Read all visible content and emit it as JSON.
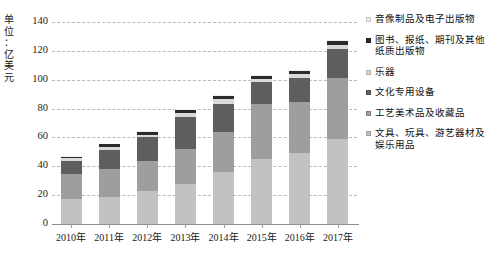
{
  "chart_data": {
    "type": "bar",
    "subtype": "stacked-vertical",
    "title": "",
    "xlabel": "",
    "ylabel": "单位：亿美元",
    "ylim": [
      0,
      140
    ],
    "ytick_step": 20,
    "yticks": [
      "140",
      "120",
      "100",
      "80",
      "60",
      "40",
      "20",
      "0"
    ],
    "grid": true,
    "grid_style": "dashed-horizontal",
    "legend_position": "right",
    "categories": [
      "2010年",
      "2011年",
      "2012年",
      "2013年",
      "2014年",
      "2015年",
      "2016年",
      "2017年"
    ],
    "series": [
      {
        "name": "文具、玩具、游艺器材及娱乐用品",
        "color": "#c2c2c2",
        "values": [
          17.0,
          18.5,
          23.0,
          27.5,
          36.0,
          45.0,
          49.0,
          59.0
        ]
      },
      {
        "name": "工艺美术品及收藏品",
        "color": "#9e9e9e",
        "values": [
          17.5,
          19.5,
          21.0,
          24.5,
          27.5,
          38.0,
          35.5,
          42.0
        ]
      },
      {
        "name": "文化专用设备",
        "color": "#5e5e5e",
        "values": [
          9.5,
          13.5,
          16.0,
          22.5,
          19.5,
          15.5,
          16.5,
          20.5
        ]
      },
      {
        "name": "乐器",
        "color": "#d9d9d9",
        "values": [
          1.7,
          1.9,
          2.0,
          2.2,
          3.5,
          2.2,
          3.0,
          2.4
        ]
      },
      {
        "name": "图书、报纸、期刊及其他纸质出版物",
        "color": "#2b2b2b",
        "values": [
          1.0,
          1.8,
          1.8,
          2.6,
          2.4,
          2.0,
          2.2,
          3.2
        ]
      },
      {
        "name": "音像制品及电子出版物",
        "color": "#efefef",
        "values": [
          0.6,
          0.6,
          0.6,
          0.6,
          0.6,
          0.6,
          0.6,
          0.6
        ]
      }
    ],
    "totals": [
      47.3,
      55.8,
      64.4,
      79.9,
      89.5,
      103.3,
      106.8,
      127.7
    ]
  },
  "legend": {
    "items": [
      {
        "label": "音像制品及电子出版物",
        "color": "#efefef"
      },
      {
        "label": "图书、报纸、期刊及其他纸质出版物",
        "color": "#2b2b2b"
      },
      {
        "label": "乐器",
        "color": "#d9d9d9"
      },
      {
        "label": "文化专用设备",
        "color": "#5e5e5e"
      },
      {
        "label": "工艺美术品及收藏品",
        "color": "#9e9e9e"
      },
      {
        "label": "文具、玩具、游艺器材及娱乐用品",
        "color": "#c2c2c2"
      }
    ]
  },
  "axis": {
    "y_title_chars": [
      "单",
      "位",
      "：",
      "亿",
      "美",
      "元"
    ]
  }
}
